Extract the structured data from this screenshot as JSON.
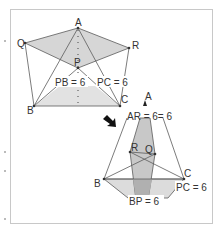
{
  "diagram": {
    "top_figure": {
      "points": {
        "A": {
          "label": "A",
          "x": 78,
          "y": 28
        },
        "Q": {
          "label": "Q",
          "x": 25,
          "y": 43
        },
        "R": {
          "label": "R",
          "x": 129,
          "y": 48
        },
        "P": {
          "label": "P",
          "x": 78,
          "y": 68
        },
        "B": {
          "label": "B",
          "x": 34,
          "y": 106
        },
        "C": {
          "label": "C",
          "x": 120,
          "y": 106
        }
      },
      "annotations": {
        "pb": "PB = 6",
        "pc": "PC = 6"
      }
    },
    "arrow": {
      "direction": "down-right"
    },
    "bottom_figure": {
      "points": {
        "A": {
          "label": "A",
          "x": 146,
          "y": 103
        },
        "R": {
          "label": "R",
          "x": 130,
          "y": 152
        },
        "Q": {
          "label": "Q",
          "x": 155,
          "y": 154
        },
        "B": {
          "label": "B",
          "x": 104,
          "y": 179
        },
        "C": {
          "label": "C",
          "x": 184,
          "y": 179
        }
      },
      "annotations": {
        "ar": "AR = 6= 6",
        "pc": "PC = 6",
        "bp": "BP = 6"
      }
    },
    "colors": {
      "fill": "#d6d6d6",
      "fill_dark": "#b8b8b8",
      "line": "#5a5a5a",
      "frame": "#c8c8c8"
    }
  }
}
